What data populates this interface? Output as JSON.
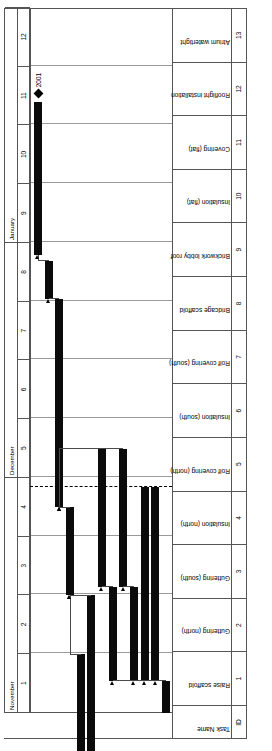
{
  "chart_data": {
    "type": "bar",
    "xlabel": "",
    "ylabel": "",
    "time_axis": {
      "months": [
        {
          "label": "November",
          "weeks": [
            1,
            2,
            3,
            4
          ]
        },
        {
          "label": "December",
          "weeks": [
            5,
            6,
            7,
            8
          ]
        },
        {
          "label": "January",
          "weeks": [
            9,
            10,
            11,
            12
          ]
        }
      ],
      "week_labels": [
        "1",
        "2",
        "3",
        "4",
        "5",
        "6",
        "7",
        "8",
        "9",
        "10",
        "11",
        "12"
      ],
      "range": [
        1,
        13
      ]
    },
    "today_marker": {
      "week": 4.85,
      "style": "dashed"
    },
    "columns": [
      "ID",
      "Task Name"
    ],
    "categories": [
      "Raise scaffold",
      "Guttering (north)",
      "Guttering (south)",
      "Insulation (north)",
      "Rolf covering (north)",
      "Insulation (south)",
      "Rolf covering (south)",
      "Bridcage scaffold",
      "Brickwork lobby roof",
      "Insulation (flat)",
      "Covering (flat)",
      "Rooflight installation",
      "Atrium watertight"
    ],
    "tasks": [
      {
        "id": "1",
        "name": "Raise scaffold",
        "start_week": 1.0,
        "end_week": 1.55,
        "type": "task"
      },
      {
        "id": "2",
        "name": "Guttering (north)",
        "start_week": 1.55,
        "end_week": 4.85,
        "type": "task"
      },
      {
        "id": "3",
        "name": "Guttering (south)",
        "start_week": 1.55,
        "end_week": 4.85,
        "type": "task"
      },
      {
        "id": "4",
        "name": "Insulation (north)",
        "start_week": 1.55,
        "end_week": 3.15,
        "type": "task"
      },
      {
        "id": "5",
        "name": "Rolf covering (north)",
        "start_week": 3.15,
        "end_week": 5.5,
        "type": "task"
      },
      {
        "id": "6",
        "name": "Insulation (south)",
        "start_week": 1.55,
        "end_week": 3.15,
        "type": "task"
      },
      {
        "id": "7",
        "name": "Rolf covering (south)",
        "start_week": 3.15,
        "end_week": 5.5,
        "type": "task"
      },
      {
        "id": "8",
        "name": "Bridcage scaffold",
        "start_week": 0.35,
        "end_week": 3.0,
        "type": "task"
      },
      {
        "id": "9",
        "name": "Brickwork lobby roof",
        "start_week": 0.35,
        "end_week": 2.0,
        "type": "task"
      },
      {
        "id": "10",
        "name": "Insulation (flat)",
        "start_week": 3.0,
        "end_week": 4.5,
        "type": "task"
      },
      {
        "id": "11",
        "name": "Covering (flat)",
        "start_week": 4.5,
        "end_week": 8.05,
        "type": "task"
      },
      {
        "id": "12",
        "name": "Rooflight installation",
        "start_week": 8.05,
        "end_week": 8.7,
        "type": "task"
      },
      {
        "id": "13",
        "name": "Atrium watertight",
        "start_week": 8.8,
        "end_week": 11.4,
        "type": "task"
      }
    ],
    "milestone": {
      "label": "2001",
      "week": 11.55,
      "row": 13
    },
    "grid": true,
    "legend": "none"
  },
  "header": {
    "id_label": "ID",
    "task_label": "Task Name"
  }
}
